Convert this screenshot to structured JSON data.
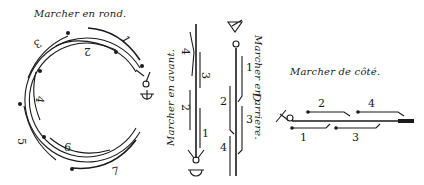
{
  "figure": {
    "kind": "engraved dance-step diagram",
    "ink_color": "#1a1a1a",
    "paper_color": "#ffffff"
  },
  "captions": {
    "round": "Marcher en rond.",
    "forward": "Marcher en avant.",
    "backward": "Marcher en arriere.",
    "sideways": "Marcher de côté."
  },
  "round_steps": {
    "labels": [
      "1",
      "2",
      "3",
      "4",
      "5",
      "6",
      "7"
    ]
  },
  "forward_steps": {
    "labels": [
      "4",
      "3",
      "2",
      "1"
    ]
  },
  "backward_steps": {
    "labels": [
      "1",
      "2",
      "3",
      "4"
    ]
  },
  "side_steps": {
    "labels": [
      "2",
      "4",
      "1",
      "3"
    ]
  },
  "stray_mark": "D"
}
